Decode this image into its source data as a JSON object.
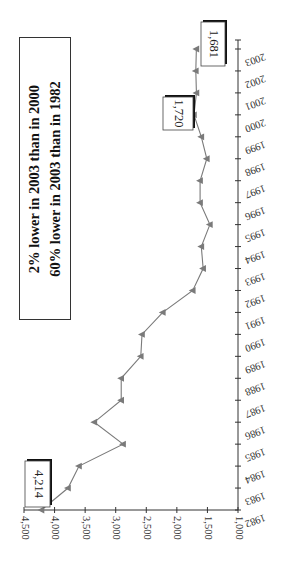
{
  "chart_data": {
    "type": "line",
    "orientation": "rotated-90-clockwise",
    "title": "",
    "xlabel": "",
    "ylabel": "",
    "categories": [
      "1982",
      "1983",
      "1984",
      "1985",
      "1986",
      "1987",
      "1988",
      "1989",
      "1990",
      "1991",
      "1992",
      "1993",
      "1994",
      "1995",
      "1996",
      "1997",
      "1998",
      "1999",
      "2000",
      "2001",
      "2002",
      "2003"
    ],
    "series": [
      {
        "name": "Value",
        "values": [
          4214,
          3780,
          3600,
          2880,
          3350,
          2910,
          2910,
          2590,
          2570,
          2230,
          1740,
          1570,
          1600,
          1460,
          1620,
          1620,
          1510,
          1600,
          1720,
          1680,
          1690,
          1681
        ],
        "color": "#7a7a7a",
        "marker": "triangle"
      }
    ],
    "ylim": [
      1000,
      4500
    ],
    "yticks": [
      4500,
      4000,
      3500,
      3000,
      2500,
      2000,
      1500,
      1000
    ],
    "ytick_labels": [
      "4,500",
      "4,000",
      "3,500",
      "3,000",
      "2,500",
      "2,000",
      "1,500",
      "1,000"
    ],
    "grid": false,
    "legend": null,
    "data_labels": [
      {
        "category": "1982",
        "text": "4,214"
      },
      {
        "category": "2000",
        "text": "1,720"
      },
      {
        "category": "2003",
        "text": "1,681"
      }
    ],
    "annotations": [
      "2% lower in 2003 than in 2000",
      "60% lower in 2003 than in 1982"
    ]
  },
  "annotation_box": {
    "line1": "2% lower in 2003 than in 2000",
    "line2": "60% lower in 2003 than in 1982"
  },
  "colors": {
    "line": "#7a7a7a",
    "marker": "#7a7a7a",
    "axis": "#333333",
    "text": "#222222"
  }
}
